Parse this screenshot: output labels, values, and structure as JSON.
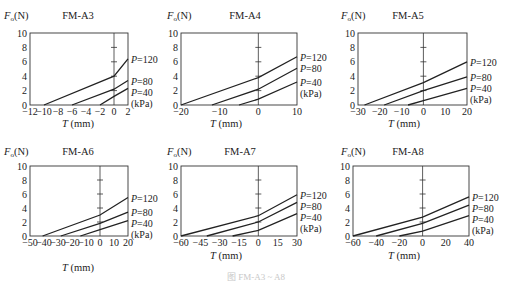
{
  "caption": "图 FM-A3 ~ A8",
  "chart_data": [
    {
      "type": "line",
      "title": "FM-A3",
      "ylabel": "F_o(N)",
      "xlabel": "T (mm)",
      "xlim": [
        -12,
        2
      ],
      "ylim": [
        0,
        10
      ],
      "xticks": [
        -12,
        -10,
        -8,
        -6,
        -4,
        -2,
        0,
        2
      ],
      "yticks": [
        0,
        2,
        4,
        6,
        8,
        10
      ],
      "legend_unit": "(kPa)",
      "series": [
        {
          "name": "P=120",
          "x": [
            -10,
            0,
            2
          ],
          "y": [
            0,
            4.0,
            6.4
          ]
        },
        {
          "name": "P=80",
          "x": [
            -6,
            0,
            2
          ],
          "y": [
            0,
            2.2,
            3.4
          ]
        },
        {
          "name": "P=40",
          "x": [
            -2,
            0,
            2
          ],
          "y": [
            0,
            1.2,
            2.3
          ]
        }
      ],
      "box": {
        "x0": 30,
        "x1": 128,
        "y0": 33,
        "y1": 105
      },
      "pos": {
        "title_x": 78,
        "title_y": 19,
        "ylabel_x": 4,
        "ylabel_y": 19,
        "xlabel_x": 78,
        "xlabel_y": 127
      }
    },
    {
      "type": "line",
      "title": "FM-A4",
      "ylabel": "F_o(N)",
      "xlabel": "T (mm)",
      "xlim": [
        -20,
        10
      ],
      "ylim": [
        0,
        10
      ],
      "xticks": [
        -20,
        -10,
        0,
        10
      ],
      "yticks": [
        0,
        2,
        4,
        6,
        8,
        10
      ],
      "legend_unit": "(kPa)",
      "series": [
        {
          "name": "P=120",
          "x": [
            -20,
            0,
            10
          ],
          "y": [
            0,
            3.8,
            6.7
          ]
        },
        {
          "name": "P=80",
          "x": [
            -12,
            0,
            10
          ],
          "y": [
            0,
            2.2,
            5.1
          ]
        },
        {
          "name": "P=40",
          "x": [
            -5,
            0,
            10
          ],
          "y": [
            0,
            0.8,
            3.2
          ]
        }
      ],
      "box": {
        "x0": 181,
        "x1": 297,
        "y0": 33,
        "y1": 105
      },
      "pos": {
        "title_x": 245,
        "title_y": 19,
        "ylabel_x": 167,
        "ylabel_y": 19,
        "xlabel_x": 226,
        "xlabel_y": 127
      }
    },
    {
      "type": "line",
      "title": "FM-A5",
      "ylabel": "F_o(N)",
      "xlabel": "T (mm)",
      "xlim": [
        -30,
        20
      ],
      "ylim": [
        0,
        10
      ],
      "xticks": [
        -30,
        -20,
        -10,
        0,
        10,
        20
      ],
      "yticks": [
        0,
        2,
        4,
        6,
        8,
        10
      ],
      "legend_unit": "(kPa)",
      "series": [
        {
          "name": "P=120",
          "x": [
            -27,
            0,
            20
          ],
          "y": [
            0,
            3.1,
            6.0
          ]
        },
        {
          "name": "P=80",
          "x": [
            -18,
            0,
            20
          ],
          "y": [
            0,
            2.0,
            3.9
          ]
        },
        {
          "name": "P=40",
          "x": [
            -7,
            0,
            20
          ],
          "y": [
            0,
            0.6,
            2.3
          ]
        }
      ],
      "box": {
        "x0": 358,
        "x1": 467,
        "y0": 33,
        "y1": 105
      },
      "pos": {
        "title_x": 408,
        "title_y": 19,
        "ylabel_x": 341,
        "ylabel_y": 19,
        "xlabel_x": 404,
        "xlabel_y": 127
      }
    },
    {
      "type": "line",
      "title": "FM-A6",
      "ylabel": "F_o(N)",
      "xlabel": "T (mm)",
      "xlim": [
        -50,
        20
      ],
      "ylim": [
        0,
        10
      ],
      "xticks": [
        -50,
        -40,
        -30,
        -20,
        -10,
        0,
        10,
        20
      ],
      "yticks": [
        0,
        2,
        4,
        6,
        8,
        10
      ],
      "legend_unit": "(kPa)",
      "series": [
        {
          "name": "P=120",
          "x": [
            -41,
            0,
            20
          ],
          "y": [
            0,
            3.0,
            5.5
          ]
        },
        {
          "name": "P=80",
          "x": [
            -28,
            0,
            20
          ],
          "y": [
            0,
            1.8,
            3.4
          ]
        },
        {
          "name": "P=40",
          "x": [
            -14,
            0,
            20
          ],
          "y": [
            0,
            0.9,
            2.2
          ]
        }
      ],
      "box": {
        "x0": 30,
        "x1": 128,
        "y0": 166,
        "y1": 236
      },
      "pos": {
        "title_x": 78,
        "title_y": 155,
        "ylabel_x": 4,
        "ylabel_y": 155,
        "xlabel_x": 78,
        "xlabel_y": 271
      }
    },
    {
      "type": "line",
      "title": "FM-A7",
      "ylabel": "F_o(N)",
      "xlabel": "T (mm)",
      "xlim": [
        -60,
        30
      ],
      "ylim": [
        0,
        10
      ],
      "xticks": [
        -60,
        -45,
        -30,
        -15,
        0,
        15,
        30
      ],
      "yticks": [
        0,
        2,
        4,
        6,
        8,
        10
      ],
      "legend_unit": "(kPa)",
      "series": [
        {
          "name": "P=120",
          "x": [
            -60,
            0,
            30
          ],
          "y": [
            0,
            2.9,
            5.9
          ]
        },
        {
          "name": "P=80",
          "x": [
            -40,
            0,
            30
          ],
          "y": [
            0,
            2.0,
            4.8
          ]
        },
        {
          "name": "P=40",
          "x": [
            -20,
            0,
            30
          ],
          "y": [
            0,
            0.8,
            3.2
          ]
        }
      ],
      "box": {
        "x0": 181,
        "x1": 297,
        "y0": 166,
        "y1": 236
      },
      "pos": {
        "title_x": 240,
        "title_y": 155,
        "ylabel_x": 167,
        "ylabel_y": 155,
        "xlabel_x": 226,
        "xlabel_y": 259
      }
    },
    {
      "type": "line",
      "title": "FM-A8",
      "ylabel": "F_o(N)",
      "xlabel": "T (mm)",
      "xlim": [
        -60,
        40
      ],
      "ylim": [
        0,
        10
      ],
      "xticks": [
        -60,
        -40,
        -20,
        0,
        20,
        40
      ],
      "yticks": [
        0,
        2,
        4,
        6,
        8,
        10
      ],
      "legend_unit": "(kPa)",
      "series": [
        {
          "name": "P=120",
          "x": [
            -60,
            0,
            40
          ],
          "y": [
            0,
            2.7,
            5.6
          ]
        },
        {
          "name": "P=80",
          "x": [
            -40,
            0,
            40
          ],
          "y": [
            0,
            1.8,
            4.4
          ]
        },
        {
          "name": "P=40",
          "x": [
            -20,
            0,
            40
          ],
          "y": [
            0,
            0.7,
            2.9
          ]
        }
      ],
      "box": {
        "x0": 353,
        "x1": 469,
        "y0": 166,
        "y1": 236
      },
      "pos": {
        "title_x": 408,
        "title_y": 155,
        "ylabel_x": 341,
        "ylabel_y": 155,
        "xlabel_x": 404,
        "xlabel_y": 259
      }
    }
  ]
}
